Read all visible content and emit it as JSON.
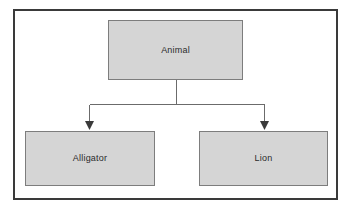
{
  "diagram": {
    "type": "class-hierarchy-tree",
    "orientation": "top-down",
    "frame": {
      "border_color": "#3a3a3a",
      "background_color": "#ffffff"
    },
    "style": {
      "node_fill": "#d5d5d5",
      "node_border": "#7d7d7d",
      "connector_color": "#6b6b6b",
      "arrow_fill": "#3a3a3a",
      "label_color": "#2b2b2b"
    },
    "nodes": [
      {
        "id": "animal",
        "label": "Animal",
        "role": "parent",
        "x": 108,
        "y": 20,
        "width": 135,
        "height": 60
      },
      {
        "id": "alligator",
        "label": "Alligator",
        "role": "child",
        "x": 25,
        "y": 131,
        "width": 130,
        "height": 55
      },
      {
        "id": "lion",
        "label": "Lion",
        "role": "child",
        "x": 199,
        "y": 131,
        "width": 129,
        "height": 55
      }
    ],
    "edges": [
      {
        "id": "animal-to-alligator",
        "from": "animal",
        "to": "alligator",
        "arrow": "filled-triangle-down"
      },
      {
        "id": "animal-to-lion",
        "from": "animal",
        "to": "lion",
        "arrow": "filled-triangle-down"
      }
    ]
  }
}
